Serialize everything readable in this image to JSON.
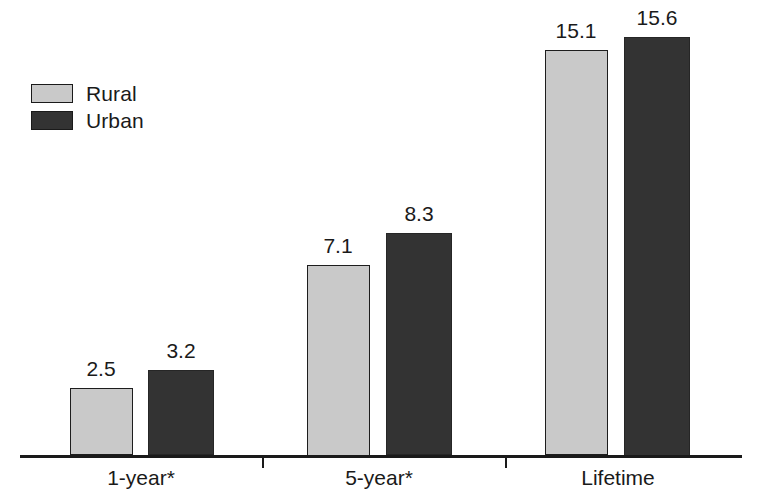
{
  "chart_data": {
    "type": "bar",
    "title": "",
    "subtitle": "",
    "xlabel": "",
    "ylabel": "",
    "categories": [
      "1-year*",
      "5-year*",
      "Lifetime"
    ],
    "series": [
      {
        "name": "Rural",
        "color": "#c9c9c9",
        "values": [
          2.5,
          7.1,
          15.1
        ]
      },
      {
        "name": "Urban",
        "color": "#333333",
        "values": [
          3.2,
          8.3,
          15.6
        ]
      }
    ],
    "value_labels": {
      "rural": [
        "2.5",
        "7.1",
        "15.1"
      ],
      "urban": [
        "3.2",
        "8.3",
        "15.6"
      ]
    },
    "ylim": [
      0,
      15.6
    ],
    "grid": false,
    "y_axis_visible": false,
    "legend_position": "top-left",
    "axis_line_color": "#1a1a1a",
    "text_color": "#1a1a1a",
    "background": "#ffffff"
  },
  "legend": {
    "items": [
      {
        "label": "Rural",
        "swatch": "legend-swatch-rural"
      },
      {
        "label": "Urban",
        "swatch": "legend-swatch-urban"
      }
    ]
  },
  "axis": {
    "categories": [
      "1-year*",
      "5-year*",
      "Lifetime"
    ]
  }
}
